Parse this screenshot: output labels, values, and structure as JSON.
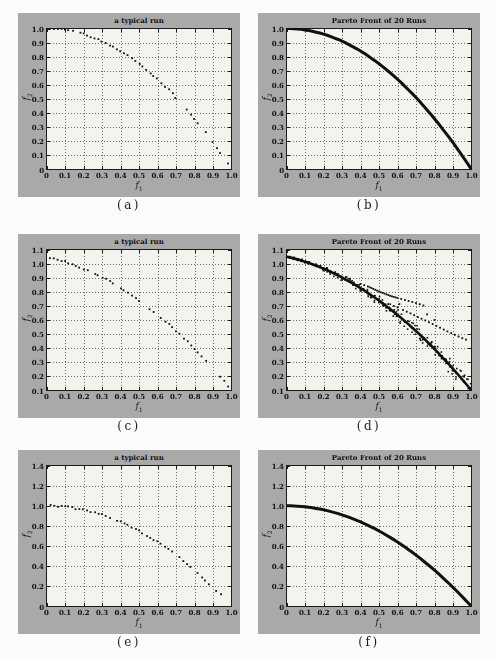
{
  "page": {
    "background": "#fcfcfa"
  },
  "colors": {
    "panel_bg": "#a9a9a9",
    "plot_bg": "#f4f4ef",
    "axis": "#1c1c1c",
    "grid": "#6e6e6e",
    "data": "#101010",
    "text": "#111111"
  },
  "chart_data": {
    "type": "scatter",
    "fronts": {
      "convex_unit": [
        [
          0,
          1
        ],
        [
          0.02,
          1
        ],
        [
          0.04,
          0.998
        ],
        [
          0.06,
          0.996
        ],
        [
          0.08,
          0.994
        ],
        [
          0.1,
          0.99
        ],
        [
          0.12,
          0.986
        ],
        [
          0.14,
          0.98
        ],
        [
          0.16,
          0.974
        ],
        [
          0.18,
          0.968
        ],
        [
          0.2,
          0.96
        ],
        [
          0.22,
          0.952
        ],
        [
          0.24,
          0.942
        ],
        [
          0.26,
          0.932
        ],
        [
          0.28,
          0.922
        ],
        [
          0.3,
          0.91
        ],
        [
          0.32,
          0.898
        ],
        [
          0.34,
          0.884
        ],
        [
          0.36,
          0.87
        ],
        [
          0.38,
          0.856
        ],
        [
          0.4,
          0.84
        ],
        [
          0.42,
          0.824
        ],
        [
          0.44,
          0.806
        ],
        [
          0.46,
          0.788
        ],
        [
          0.48,
          0.77
        ],
        [
          0.5,
          0.75
        ],
        [
          0.52,
          0.73
        ],
        [
          0.54,
          0.708
        ],
        [
          0.56,
          0.686
        ],
        [
          0.58,
          0.664
        ],
        [
          0.6,
          0.64
        ],
        [
          0.62,
          0.616
        ],
        [
          0.64,
          0.59
        ],
        [
          0.66,
          0.564
        ],
        [
          0.68,
          0.538
        ],
        [
          0.7,
          0.51
        ],
        [
          0.72,
          0.482
        ],
        [
          0.74,
          0.452
        ],
        [
          0.76,
          0.422
        ],
        [
          0.78,
          0.392
        ],
        [
          0.8,
          0.36
        ],
        [
          0.82,
          0.328
        ],
        [
          0.84,
          0.294
        ],
        [
          0.86,
          0.26
        ],
        [
          0.88,
          0.226
        ],
        [
          0.9,
          0.19
        ],
        [
          0.92,
          0.154
        ],
        [
          0.94,
          0.116
        ],
        [
          0.96,
          0.078
        ],
        [
          0.98,
          0.04
        ],
        [
          1,
          0
        ]
      ],
      "shifted": [
        [
          0,
          1.05
        ],
        [
          0.02,
          1.044
        ],
        [
          0.04,
          1.037
        ],
        [
          0.06,
          1.03
        ],
        [
          0.08,
          1.022
        ],
        [
          0.1,
          1.014
        ],
        [
          0.12,
          1.005
        ],
        [
          0.14,
          0.995
        ],
        [
          0.16,
          0.985
        ],
        [
          0.18,
          0.975
        ],
        [
          0.2,
          0.964
        ],
        [
          0.22,
          0.953
        ],
        [
          0.24,
          0.941
        ],
        [
          0.26,
          0.928
        ],
        [
          0.28,
          0.915
        ],
        [
          0.3,
          0.902
        ],
        [
          0.32,
          0.887
        ],
        [
          0.34,
          0.873
        ],
        [
          0.36,
          0.858
        ],
        [
          0.38,
          0.842
        ],
        [
          0.4,
          0.826
        ],
        [
          0.42,
          0.809
        ],
        [
          0.44,
          0.792
        ],
        [
          0.46,
          0.774
        ],
        [
          0.48,
          0.756
        ],
        [
          0.5,
          0.738
        ],
        [
          0.52,
          0.718
        ],
        [
          0.54,
          0.698
        ],
        [
          0.56,
          0.678
        ],
        [
          0.58,
          0.657
        ],
        [
          0.6,
          0.636
        ],
        [
          0.62,
          0.614
        ],
        [
          0.64,
          0.592
        ],
        [
          0.66,
          0.569
        ],
        [
          0.68,
          0.545
        ],
        [
          0.7,
          0.522
        ],
        [
          0.72,
          0.497
        ],
        [
          0.74,
          0.472
        ],
        [
          0.76,
          0.447
        ],
        [
          0.78,
          0.421
        ],
        [
          0.8,
          0.394
        ],
        [
          0.82,
          0.367
        ],
        [
          0.84,
          0.339
        ],
        [
          0.86,
          0.311
        ],
        [
          0.88,
          0.283
        ],
        [
          0.9,
          0.254
        ],
        [
          0.92,
          0.224
        ],
        [
          0.94,
          0.194
        ],
        [
          0.96,
          0.163
        ],
        [
          0.98,
          0.132
        ],
        [
          1,
          0.1
        ]
      ]
    },
    "outliers_d": [
      [
        0.4,
        0.856
      ],
      [
        0.42,
        0.847
      ],
      [
        0.44,
        0.838
      ],
      [
        0.45,
        0.832
      ],
      [
        0.46,
        0.826
      ],
      [
        0.47,
        0.82
      ],
      [
        0.48,
        0.814
      ],
      [
        0.49,
        0.808
      ],
      [
        0.5,
        0.802
      ],
      [
        0.51,
        0.797
      ],
      [
        0.52,
        0.792
      ],
      [
        0.53,
        0.787
      ],
      [
        0.54,
        0.782
      ],
      [
        0.55,
        0.777
      ],
      [
        0.56,
        0.772
      ],
      [
        0.57,
        0.768
      ],
      [
        0.58,
        0.764
      ],
      [
        0.59,
        0.76
      ],
      [
        0.6,
        0.756
      ],
      [
        0.62,
        0.749
      ],
      [
        0.64,
        0.742
      ],
      [
        0.66,
        0.735
      ],
      [
        0.68,
        0.728
      ],
      [
        0.7,
        0.72
      ],
      [
        0.72,
        0.712
      ],
      [
        0.74,
        0.703
      ],
      [
        0.55,
        0.713
      ],
      [
        0.58,
        0.7
      ],
      [
        0.61,
        0.713
      ],
      [
        0.6,
        0.69
      ],
      [
        0.63,
        0.671
      ],
      [
        0.65,
        0.659
      ],
      [
        0.67,
        0.647
      ],
      [
        0.69,
        0.634
      ],
      [
        0.71,
        0.621
      ],
      [
        0.73,
        0.609
      ],
      [
        0.75,
        0.597
      ],
      [
        0.77,
        0.584
      ],
      [
        0.79,
        0.571
      ],
      [
        0.81,
        0.558
      ],
      [
        0.83,
        0.545
      ],
      [
        0.85,
        0.532
      ],
      [
        0.87,
        0.519
      ],
      [
        0.89,
        0.507
      ],
      [
        0.91,
        0.495
      ],
      [
        0.93,
        0.483
      ],
      [
        0.95,
        0.471
      ],
      [
        0.97,
        0.461
      ],
      [
        0.76,
        0.64
      ],
      [
        0.8,
        0.6
      ]
    ],
    "plots": [
      {
        "id": "a",
        "caption": "(a)",
        "title": "a typical run",
        "style": "scatter",
        "front": "convex_unit",
        "seed": 7,
        "xlim": [
          0,
          1
        ],
        "ylim": [
          0,
          1
        ],
        "xticks": [
          "0",
          "0.1",
          "0.2",
          "0.3",
          "0.4",
          "0.5",
          "0.6",
          "0.7",
          "0.8",
          "0.9",
          "1.0"
        ],
        "yticks": [
          "0",
          "0.1",
          "0.2",
          "0.3",
          "0.4",
          "0.5",
          "0.6",
          "0.7",
          "0.8",
          "0.9",
          "1.0"
        ],
        "xlabel_base": "f",
        "xlabel_sub": "1",
        "ylabel_base": "f",
        "ylabel_sub": "2"
      },
      {
        "id": "b",
        "caption": "(b)",
        "title": "Pareto Front of 20 Runs",
        "style": "line",
        "front": "convex_unit",
        "seed": 3,
        "xlim": [
          0,
          1
        ],
        "ylim": [
          0,
          1
        ],
        "xticks": [
          "0",
          "0.1",
          "0.2",
          "0.3",
          "0.4",
          "0.5",
          "0.6",
          "0.7",
          "0.8",
          "0.9",
          "1.0"
        ],
        "yticks": [
          "0",
          "0.1",
          "0.2",
          "0.3",
          "0.4",
          "0.5",
          "0.6",
          "0.7",
          "0.8",
          "0.9",
          "1.0"
        ],
        "xlabel_base": "f",
        "xlabel_sub": "1",
        "ylabel_base": "f",
        "ylabel_sub": "2"
      },
      {
        "id": "c",
        "caption": "(c)",
        "title": "a typical run",
        "style": "scatter",
        "front": "shifted",
        "seed": 11,
        "xlim": [
          0,
          1
        ],
        "ylim": [
          0.1,
          1.1
        ],
        "xticks": [
          "0",
          "0.1",
          "0.2",
          "0.3",
          "0.4",
          "0.5",
          "0.6",
          "0.7",
          "0.8",
          "0.9",
          "1.0"
        ],
        "yticks": [
          "0.1",
          "0.2",
          "0.3",
          "0.4",
          "0.5",
          "0.6",
          "0.7",
          "0.8",
          "0.9",
          "1.0",
          "1.1"
        ],
        "xlabel_base": "f",
        "xlabel_sub": "1",
        "ylabel_base": "f",
        "ylabel_sub": "2"
      },
      {
        "id": "d",
        "caption": "(d)",
        "title": "Pareto Front of 20 Runs",
        "style": "band",
        "front": "shifted",
        "outliers": "outliers_d",
        "seed": 5,
        "xlim": [
          0,
          1
        ],
        "ylim": [
          0.1,
          1.1
        ],
        "xticks": [
          "0",
          "0.1",
          "0.2",
          "0.3",
          "0.4",
          "0.5",
          "0.6",
          "0.7",
          "0.8",
          "0.9",
          "1.0"
        ],
        "yticks": [
          "0.1",
          "0.2",
          "0.3",
          "0.4",
          "0.5",
          "0.6",
          "0.7",
          "0.8",
          "0.9",
          "1.0",
          "1.1"
        ],
        "xlabel_base": "f",
        "xlabel_sub": "1",
        "ylabel_base": "f",
        "ylabel_sub": "2"
      },
      {
        "id": "e",
        "caption": "(e)",
        "title": "a typical run",
        "style": "scatter",
        "front": "convex_unit",
        "seed": 13,
        "xlim": [
          0,
          1
        ],
        "ylim": [
          0,
          1.4
        ],
        "xticks": [
          "0",
          "0.1",
          "0.2",
          "0.3",
          "0.4",
          "0.5",
          "0.6",
          "0.7",
          "0.8",
          "0.9",
          "1.0"
        ],
        "yticks": [
          "0",
          "0.2",
          "0.4",
          "0.6",
          "0.8",
          "1.0",
          "1.2",
          "1.4"
        ],
        "xlabel_base": "f",
        "xlabel_sub": "1",
        "ylabel_base": "f",
        "ylabel_sub": "2"
      },
      {
        "id": "f",
        "caption": "(f)",
        "title": "Pareto Front of 20 Runs",
        "style": "line",
        "front": "convex_unit",
        "seed": 9,
        "xlim": [
          0,
          1
        ],
        "ylim": [
          0,
          1.4
        ],
        "xticks": [
          "0",
          "0.1",
          "0.2",
          "0.3",
          "0.4",
          "0.5",
          "0.6",
          "0.7",
          "0.8",
          "0.9",
          "1.0"
        ],
        "yticks": [
          "0",
          "0.2",
          "0.4",
          "0.6",
          "0.8",
          "1.0",
          "1.2",
          "1.4"
        ],
        "xlabel_base": "f",
        "xlabel_sub": "1",
        "ylabel_base": "f",
        "ylabel_sub": "2"
      }
    ]
  }
}
